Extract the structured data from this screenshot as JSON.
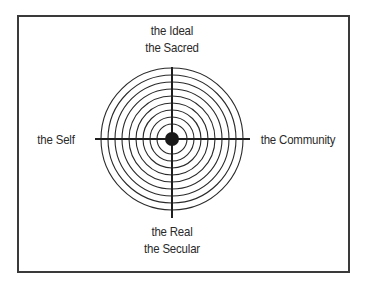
{
  "diagram": {
    "labels": {
      "top": [
        "the Ideal",
        "the Sacred"
      ],
      "bottom": [
        "the Real",
        "the Secular"
      ],
      "left": "the Self",
      "right": "the Community"
    },
    "rings": {
      "count": 9,
      "radii": [
        71,
        64,
        57,
        50,
        43,
        36,
        29,
        22,
        15
      ],
      "center": [
        172,
        139
      ]
    },
    "center_dot_radius": 7,
    "colors": {
      "stroke": "#2a2a2a",
      "frame": "#3a3a3a",
      "background": "#ffffff"
    }
  }
}
